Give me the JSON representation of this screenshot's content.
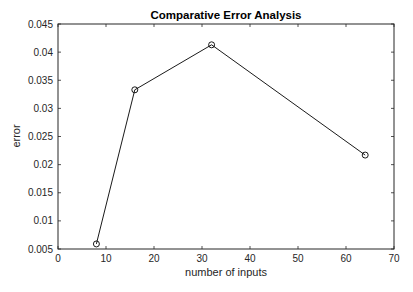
{
  "chart_data": {
    "type": "line",
    "title": "Comparative Error Analysis",
    "xlabel": "number of inputs",
    "ylabel": "error",
    "xlim": [
      0,
      70
    ],
    "ylim": [
      0.005,
      0.045
    ],
    "xticks": [
      0,
      10,
      20,
      30,
      40,
      50,
      60,
      70
    ],
    "yticks": [
      0.005,
      0.01,
      0.015,
      0.02,
      0.025,
      0.03,
      0.035,
      0.04,
      0.045
    ],
    "xtick_labels": [
      "0",
      "10",
      "20",
      "30",
      "40",
      "50",
      "60",
      "70"
    ],
    "ytick_labels": [
      "0.005",
      "0.01",
      "0.015",
      "0.02",
      "0.025",
      "0.03",
      "0.035",
      "0.04",
      "0.045"
    ],
    "grid": false,
    "legend": null,
    "series": [
      {
        "name": "error",
        "marker": "circle",
        "color": "#000000",
        "x": [
          8,
          16,
          32,
          64
        ],
        "y": [
          0.0059,
          0.0333,
          0.0413,
          0.0217
        ]
      }
    ]
  }
}
